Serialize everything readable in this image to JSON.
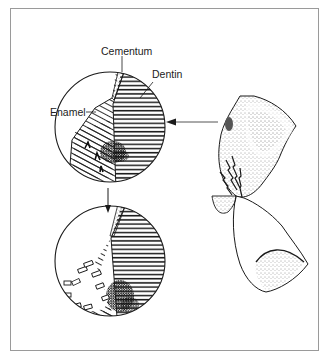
{
  "figure": {
    "labels": {
      "cementum": "Cementum",
      "dentin": "Dentin",
      "enamel": "Enamel"
    },
    "panels": [
      {
        "name": "magnified-cross-section-before",
        "description": "Circular magnified view of enamel, dentin and cementum with dark lesion at junction"
      },
      {
        "name": "magnified-cross-section-after",
        "description": "Circular magnified view with enamel fragments breaking away"
      },
      {
        "name": "tooth-illustration",
        "description": "Stippled tooth crowns with fracture lines near cervical area"
      }
    ],
    "colors": {
      "frame": "#9a9a9a",
      "ink": "#1a1a1a",
      "background": "#ffffff"
    }
  }
}
